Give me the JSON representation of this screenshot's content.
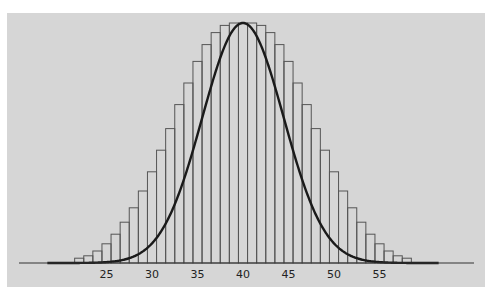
{
  "chart_data": {
    "type": "bar",
    "title": "",
    "subtitle": "",
    "xlabel": "",
    "ylabel": "",
    "categories": [
      22,
      23,
      24,
      25,
      26,
      27,
      28,
      29,
      30,
      31,
      32,
      33,
      34,
      35,
      36,
      37,
      38,
      39,
      40,
      41,
      42,
      43,
      44,
      45,
      46,
      47,
      48,
      49,
      50,
      51,
      52,
      53,
      54,
      55,
      56,
      57,
      58
    ],
    "values": [
      0.02,
      0.03,
      0.05,
      0.08,
      0.12,
      0.17,
      0.23,
      0.3,
      0.38,
      0.47,
      0.56,
      0.66,
      0.75,
      0.84,
      0.91,
      0.96,
      0.99,
      1.0,
      1.0,
      1.0,
      0.99,
      0.96,
      0.91,
      0.84,
      0.75,
      0.66,
      0.56,
      0.47,
      0.38,
      0.3,
      0.23,
      0.17,
      0.12,
      0.08,
      0.05,
      0.03,
      0.02
    ],
    "value_units": "relative height (peak = 1)",
    "curve": {
      "type": "normal",
      "mean": 40,
      "sd": 4.47,
      "x_range": [
        18.5,
        61.5
      ]
    },
    "xticks": [
      25,
      30,
      35,
      40,
      45,
      50,
      55
    ],
    "xlim": [
      16.5,
      62.5
    ],
    "ylim": [
      0,
      1.05
    ],
    "grid": false,
    "legend": null,
    "colors": {
      "background": "#d6d6d6",
      "bars": "#555555",
      "curve": "#1a1a1a",
      "axis": "#333333"
    }
  },
  "axis": {
    "ticks": [
      "25",
      "30",
      "35",
      "40",
      "45",
      "50",
      "55"
    ]
  }
}
